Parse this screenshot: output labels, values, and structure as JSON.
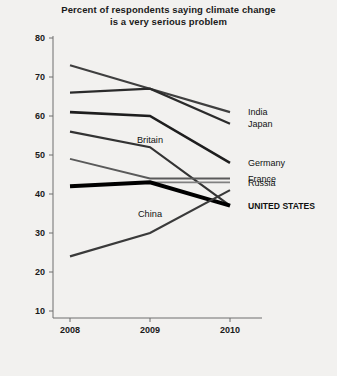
{
  "chart_data": {
    "type": "line",
    "title": "Percent of respondents saying climate change is a very serious problem",
    "title_line1": "Percent of respondents saying climate change",
    "title_line2": "is a very serious problem",
    "xlabel": "",
    "ylabel": "",
    "categories": [
      "2008",
      "2009",
      "2010"
    ],
    "x": [
      2008,
      2009,
      2010
    ],
    "ylim": [
      10,
      80
    ],
    "yticks": [
      80,
      70,
      60,
      50,
      40,
      30,
      20,
      10
    ],
    "ytick_labels": [
      "80",
      "70",
      "60",
      "50",
      "40",
      "30",
      "20",
      "10"
    ],
    "xtick_labels": [
      "2008",
      "2009",
      "2010"
    ],
    "grid": false,
    "legend_position": "right-inline",
    "series": [
      {
        "name": "India",
        "label": "India",
        "label_position": "right",
        "values": [
          73,
          67,
          61
        ],
        "color": "#3f3f3f",
        "width": 2.2,
        "emphasis": false
      },
      {
        "name": "Japan",
        "label": "Japan",
        "label_position": "right",
        "values": [
          66,
          67,
          58
        ],
        "color": "#2b2b2b",
        "width": 2.2,
        "emphasis": false
      },
      {
        "name": "Germany",
        "label": "Germany",
        "label_position": "right",
        "values": [
          61,
          60,
          48
        ],
        "color": "#1e1e1e",
        "width": 2.6,
        "emphasis": false
      },
      {
        "name": "Britain",
        "label": "Britain",
        "label_position": "inline",
        "values": [
          56,
          52,
          37
        ],
        "color": "#333333",
        "width": 2.2,
        "emphasis": false
      },
      {
        "name": "France",
        "label": "France",
        "label_position": "right",
        "values": [
          49,
          44,
          44
        ],
        "color": "#5a5a5a",
        "width": 2.0,
        "emphasis": false
      },
      {
        "name": "Russia",
        "label": "Russia",
        "label_position": "right",
        "values": [
          42,
          43,
          43
        ],
        "color": "#808080",
        "width": 1.8,
        "emphasis": false
      },
      {
        "name": "UNITED STATES",
        "label": "UNITED STATES",
        "label_position": "right",
        "values": [
          42,
          43,
          37
        ],
        "color": "#000000",
        "width": 4.0,
        "emphasis": true
      },
      {
        "name": "China",
        "label": "China",
        "label_position": "inline",
        "values": [
          24,
          30,
          41
        ],
        "color": "#3a3a3a",
        "width": 2.2,
        "emphasis": false
      }
    ],
    "inline_labels": [
      {
        "text": "Britain",
        "x": 2009,
        "y": 53
      },
      {
        "text": "China",
        "x": 2009,
        "y": 34
      }
    ],
    "right_labels": [
      {
        "text": "India",
        "y": 61
      },
      {
        "text": "Japan",
        "y": 58
      },
      {
        "text": "Germany",
        "y": 48
      },
      {
        "text": "France",
        "y": 44
      },
      {
        "text": "Russia",
        "y": 43
      },
      {
        "text": "UNITED STATES",
        "y": 37
      }
    ]
  }
}
